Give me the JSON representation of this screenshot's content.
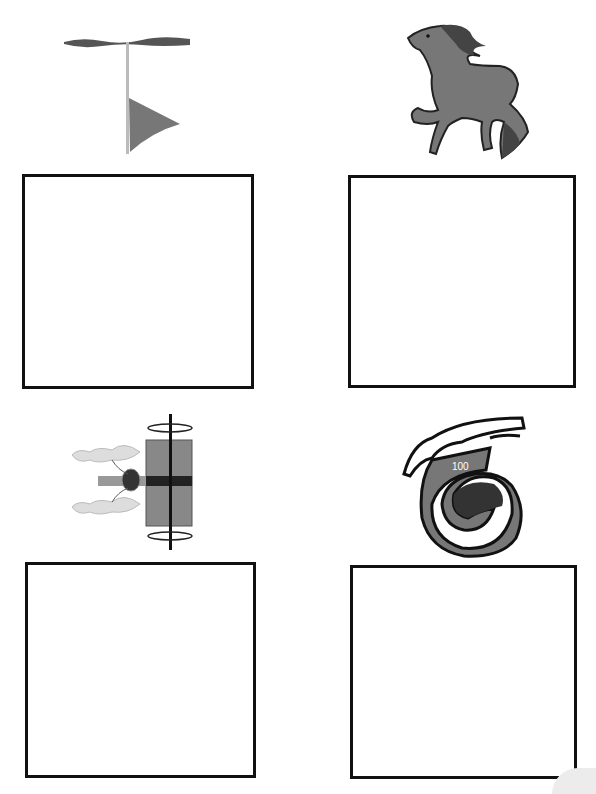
{
  "worksheet": {
    "cells": [
      {
        "picture": "flag-icon",
        "answer_box": ""
      },
      {
        "picture": "horse-icon",
        "answer_box": ""
      },
      {
        "picture": "chariot-icon",
        "answer_box": ""
      },
      {
        "picture": "hand-scroll-100-icon",
        "answer_box": ""
      }
    ],
    "scroll_label": "100"
  },
  "colors": {
    "border": "#111111",
    "gray_fill": "#7a7a7a",
    "dark_fill": "#333333"
  }
}
